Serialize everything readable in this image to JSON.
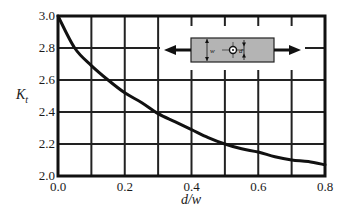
{
  "chart_data": {
    "type": "line",
    "title": "",
    "xlabel": "d/w",
    "ylabel": "K",
    "ylabel_subscript": "t",
    "xlim": [
      0.0,
      0.8
    ],
    "ylim": [
      2.0,
      3.0
    ],
    "grid": true,
    "x_ticks": [
      "0.0",
      "0.2",
      "0.4",
      "0.6",
      "0.8"
    ],
    "y_ticks": [
      "2.0",
      "2.2",
      "2.4",
      "2.6",
      "2.8",
      "3.0"
    ],
    "x_grid_step": 0.1,
    "y_grid_step": 0.2,
    "series": [
      {
        "name": "Kt",
        "x": [
          0.0,
          0.05,
          0.1,
          0.15,
          0.2,
          0.25,
          0.3,
          0.35,
          0.4,
          0.45,
          0.5,
          0.55,
          0.6,
          0.65,
          0.7,
          0.75,
          0.8
        ],
        "values": [
          3.0,
          2.8,
          2.69,
          2.6,
          2.52,
          2.46,
          2.39,
          2.34,
          2.29,
          2.24,
          2.2,
          2.17,
          2.15,
          2.12,
          2.1,
          2.09,
          2.07
        ]
      }
    ],
    "inset": {
      "description": "Plate of width w with central hole of diameter d under axial tension",
      "labels": [
        "w",
        "d"
      ]
    }
  }
}
